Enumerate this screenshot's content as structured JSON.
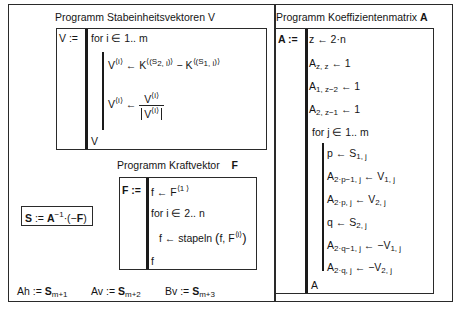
{
  "left_panel": {
    "v_program": {
      "title": "Programm Stabeinheitsvektoren  V",
      "assign": "V :=",
      "lines": {
        "for": "for  i ∈ 1.. m",
        "v_lhs": "V",
        "v_sup": "⟨i⟩",
        "arrow": "←",
        "k1": "K",
        "k1_sup": "⟨(S",
        "k1_sub": "2, i",
        "k1_close": ")⟩",
        "minus": " − ",
        "k2": "K",
        "k2_sup": "⟨(S",
        "k2_sub": "1, i",
        "k2_close": ")⟩",
        "norm_num": "V",
        "norm_den": "V",
        "result": "V"
      }
    },
    "f_program": {
      "title": "Programm Kraftvektor",
      "title_var": "F",
      "assign": "F :=",
      "lines": {
        "l1_lhs": "f ← F",
        "l1_sup": "⟨1 ⟩",
        "for": "for  i ∈ 2.. n",
        "l3_lhs": "f ← stapeln",
        "l3_args": "f, F",
        "l3_sup": "⟨i⟩",
        "result": "f"
      }
    },
    "solve": {
      "lhs": "S",
      "assign": " := ",
      "a": "A",
      "a_sup": "−1",
      "rest": "·(−",
      "f": "F",
      "close": ")"
    },
    "results": [
      {
        "name": "Ah := ",
        "var": "S",
        "sub": "m+1"
      },
      {
        "name": "Av := ",
        "var": "S",
        "sub": "m+2"
      },
      {
        "name": "Bv := ",
        "var": "S",
        "sub": "m+3"
      }
    ]
  },
  "right_panel": {
    "title": "Programm Koeffizientenmatrix",
    "title_var": "A",
    "assign": "A :=",
    "lines": [
      {
        "base": "z ← 2·n"
      },
      {
        "base": "A",
        "sub": "z, z",
        "rest": " ← 1"
      },
      {
        "base": "A",
        "sub": "1, z−2",
        "rest": " ← 1"
      },
      {
        "base": "A",
        "sub": "2, z−1",
        "rest": " ← 1"
      },
      {
        "base": "for  j ∈ 1.. m"
      }
    ],
    "loop_lines": [
      {
        "base": "p ← S",
        "sub": "1, j",
        "rest": ""
      },
      {
        "base": "A",
        "sub": "2·p−1, j",
        "rest": " ← V",
        "sub2": "1, j"
      },
      {
        "base": "A",
        "sub": "2·p, j",
        "rest": " ← V",
        "sub2": "2, j"
      },
      {
        "base": "q ← S",
        "sub": "2, j",
        "rest": ""
      },
      {
        "base": "A",
        "sub": "2·q−1, j",
        "rest": " ← −V",
        "sub2": "1, j"
      },
      {
        "base": "A",
        "sub": "2·q, j",
        "rest": " ← −V",
        "sub2": "2, j"
      }
    ],
    "result": "A"
  }
}
